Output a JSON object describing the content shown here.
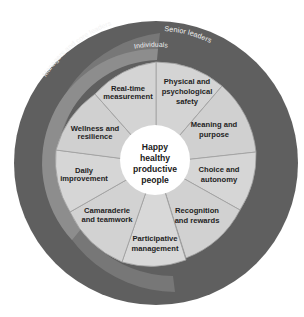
{
  "diagram": {
    "title": "Happy healthy productive people",
    "center": {
      "lines": [
        "Happy",
        "healthy",
        "productive",
        "people"
      ],
      "fill": "#ffffff"
    },
    "rings": [
      {
        "label": "Senior leaders",
        "fill": "#5f5f5f"
      },
      {
        "label": "Managers and core leaders",
        "fill": "#777777"
      },
      {
        "label": "Individuals",
        "fill": "#8d8d8d"
      }
    ],
    "segments": [
      {
        "id": "physical-psychological-safety",
        "lines": [
          "Physical and",
          "psychological",
          "safety"
        ]
      },
      {
        "id": "meaning-purpose",
        "lines": [
          "Meaning and",
          "purpose"
        ]
      },
      {
        "id": "choice-autonomy",
        "lines": [
          "Choice and",
          "autonomy"
        ]
      },
      {
        "id": "recognition-rewards",
        "lines": [
          "Recognition",
          "and rewards"
        ]
      },
      {
        "id": "participative-management",
        "lines": [
          "Participative",
          "management"
        ]
      },
      {
        "id": "camaraderie-teamwork",
        "lines": [
          "Camaraderie",
          "and teamwork"
        ]
      },
      {
        "id": "daily-improvement",
        "lines": [
          "Daily",
          "improvement"
        ]
      },
      {
        "id": "wellness-resilience",
        "lines": [
          "Wellness and",
          "resilience"
        ]
      },
      {
        "id": "real-time-measurement",
        "lines": [
          "Real-time",
          "measurement"
        ]
      }
    ],
    "colors": {
      "segment_fill": "#d3d3d3",
      "segment_edge": "#9a9a9a",
      "text": "#1e1e1e",
      "ring_text": "#f2f2f2"
    }
  }
}
